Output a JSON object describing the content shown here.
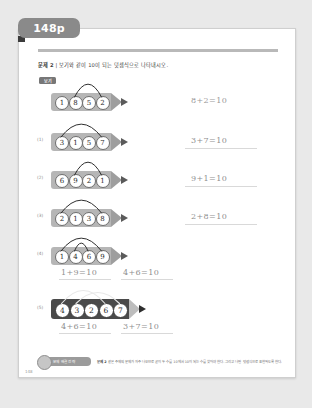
{
  "tab": {
    "label": "148p"
  },
  "instruction": {
    "number": "문제 2",
    "separator": "|",
    "text": "보기와 같이 10이 되는 덧셈식으로 나타내시오."
  },
  "example_badge": "보기",
  "rows": [
    {
      "marker": "",
      "is_example": true,
      "pencil_style": "light",
      "numbers": [
        "1",
        "8",
        "5",
        "2"
      ],
      "arcs": [
        {
          "from": 1,
          "to": 3
        }
      ],
      "answers": [
        "8+2=10"
      ],
      "answer_prefilled": true,
      "show_answer_line": false
    },
    {
      "marker": "(1)",
      "is_example": false,
      "pencil_style": "light",
      "numbers": [
        "3",
        "1",
        "5",
        "7"
      ],
      "arcs": [
        {
          "from": 0,
          "to": 3
        }
      ],
      "answers": [
        "3+7=10"
      ],
      "answer_prefilled": false,
      "show_answer_line": true
    },
    {
      "marker": "(2)",
      "is_example": false,
      "pencil_style": "light",
      "numbers": [
        "6",
        "9",
        "2",
        "1"
      ],
      "arcs": [
        {
          "from": 1,
          "to": 3
        }
      ],
      "answers": [
        "9+1=10"
      ],
      "answer_prefilled": false,
      "show_answer_line": true
    },
    {
      "marker": "(3)",
      "is_example": false,
      "pencil_style": "light",
      "numbers": [
        "2",
        "1",
        "3",
        "8"
      ],
      "arcs": [
        {
          "from": 0,
          "to": 3
        }
      ],
      "answers": [
        "2+8=10"
      ],
      "answer_prefilled": false,
      "show_answer_line": true
    },
    {
      "marker": "(4)",
      "is_example": false,
      "pencil_style": "light",
      "numbers": [
        "1",
        "4",
        "6",
        "9"
      ],
      "arcs": [
        {
          "from": 0,
          "to": 3
        },
        {
          "from": 1,
          "to": 2
        }
      ],
      "answers": [
        "1+9=10",
        "4+6=10"
      ],
      "answer_prefilled": false,
      "show_answer_line": true
    },
    {
      "marker": "(5)",
      "is_example": false,
      "pencil_style": "dark",
      "numbers": [
        "4",
        "3",
        "2",
        "6",
        "7"
      ],
      "arcs": [
        {
          "from": 0,
          "to": 3
        },
        {
          "from": 1,
          "to": 4
        }
      ],
      "answers": [
        "4+6=10",
        "3+7=10"
      ],
      "answer_prefilled": false,
      "show_answer_line": true
    }
  ],
  "footer": {
    "badge_label": "문제 해결 전략",
    "note_label": "문제 2",
    "note_text": "같은 주제의 문제가 자주 나오므로 굳이 두 수를 10에서 10이 되는 수를 찾아야 한다. 그리고 나면 덧셈식으로 표현하도록 한다."
  },
  "page_number": "148",
  "colors": {
    "tab_bg": "#8a8a8a",
    "pencil_light": "#b6b6b6",
    "pencil_dark": "#4a4a4a",
    "answer_text": "#8f8f8f",
    "paper": "#ffffff"
  }
}
